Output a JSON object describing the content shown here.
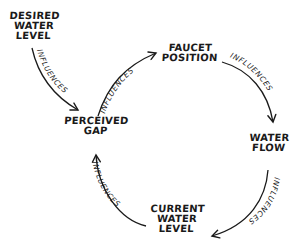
{
  "diagram": {
    "type": "causal-loop",
    "nodes": [
      {
        "id": "desired",
        "lines": [
          "DESIRED",
          "WATER",
          "LEVEL"
        ]
      },
      {
        "id": "gap",
        "lines": [
          "PERCEIVED",
          "GAP"
        ]
      },
      {
        "id": "faucet",
        "lines": [
          "FAUCET",
          "POSITION"
        ]
      },
      {
        "id": "flow",
        "lines": [
          "WATER",
          "FLOW"
        ]
      },
      {
        "id": "current",
        "lines": [
          "CURRENT",
          "WATER",
          "LEVEL"
        ]
      }
    ],
    "edges": [
      {
        "from": "desired",
        "to": "gap",
        "label": "INFLUENCES"
      },
      {
        "from": "gap",
        "to": "faucet",
        "label": "INFLUENCES"
      },
      {
        "from": "faucet",
        "to": "flow",
        "label": "INFLUENCES"
      },
      {
        "from": "flow",
        "to": "current",
        "label": "INFLUENCES"
      },
      {
        "from": "current",
        "to": "gap",
        "label": "INFLUENCES"
      }
    ],
    "colors": {
      "ink": "#1a1a1a",
      "background": "#ffffff"
    }
  }
}
